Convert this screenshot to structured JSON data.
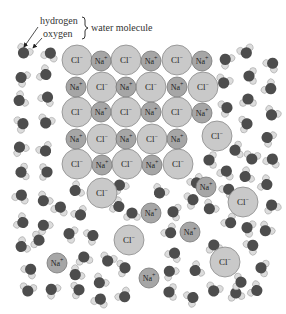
{
  "legend": {
    "hydrogen_label": "hydrogen",
    "oxygen_label": "oxygen",
    "molecule_label": "water molecule"
  },
  "colors": {
    "chloride_fill": "#c9c9c9",
    "chloride_stroke": "#8a8a8a",
    "sodium_fill": "#a6a6a6",
    "sodium_stroke": "#777777",
    "oxygen_fill": "#4d4d4d",
    "hydrogen_fill": "#dcdcdc",
    "hydrogen_stroke": "#999999"
  },
  "ions": [
    {
      "type": "Cl",
      "label": "Cl−",
      "x": 77,
      "y": 60
    },
    {
      "type": "Na",
      "label": "Na+",
      "x": 101,
      "y": 61
    },
    {
      "type": "Cl",
      "label": "Cl−",
      "x": 126,
      "y": 60
    },
    {
      "type": "Na",
      "label": "Na+",
      "x": 151,
      "y": 61
    },
    {
      "type": "Cl",
      "label": "Cl−",
      "x": 177,
      "y": 60
    },
    {
      "type": "Na",
      "label": "Na+",
      "x": 202,
      "y": 61
    },
    {
      "type": "Na",
      "label": "Na+",
      "x": 76,
      "y": 87
    },
    {
      "type": "Cl",
      "label": "Cl−",
      "x": 102,
      "y": 87
    },
    {
      "type": "Na",
      "label": "Na+",
      "x": 126,
      "y": 87
    },
    {
      "type": "Cl",
      "label": "Cl−",
      "x": 151,
      "y": 87
    },
    {
      "type": "Na",
      "label": "Na+",
      "x": 177,
      "y": 87
    },
    {
      "type": "Cl",
      "label": "Cl−",
      "x": 203,
      "y": 87
    },
    {
      "type": "Cl",
      "label": "Cl−",
      "x": 77,
      "y": 112
    },
    {
      "type": "Na",
      "label": "Na+",
      "x": 101,
      "y": 112
    },
    {
      "type": "Cl",
      "label": "Cl−",
      "x": 126,
      "y": 112
    },
    {
      "type": "Na",
      "label": "Na+",
      "x": 151,
      "y": 112
    },
    {
      "type": "Cl",
      "label": "Cl−",
      "x": 177,
      "y": 112
    },
    {
      "type": "Na",
      "label": "Na+",
      "x": 202,
      "y": 113
    },
    {
      "type": "Na",
      "label": "Na+",
      "x": 76,
      "y": 139
    },
    {
      "type": "Cl",
      "label": "Cl−",
      "x": 102,
      "y": 139
    },
    {
      "type": "Na",
      "label": "Na+",
      "x": 126,
      "y": 139
    },
    {
      "type": "Cl",
      "label": "Cl−",
      "x": 152,
      "y": 139
    },
    {
      "type": "Na",
      "label": "Na+",
      "x": 177,
      "y": 139
    },
    {
      "type": "Cl",
      "label": "Cl−",
      "x": 217,
      "y": 136
    },
    {
      "type": "Cl",
      "label": "Cl−",
      "x": 77,
      "y": 164
    },
    {
      "type": "Na",
      "label": "Na+",
      "x": 102,
      "y": 165
    },
    {
      "type": "Cl",
      "label": "Cl−",
      "x": 127,
      "y": 164
    },
    {
      "type": "Na",
      "label": "Na+",
      "x": 152,
      "y": 165
    },
    {
      "type": "Cl",
      "label": "Cl−",
      "x": 178,
      "y": 164
    },
    {
      "type": "Cl",
      "label": "Cl−",
      "x": 102,
      "y": 193
    },
    {
      "type": "Na",
      "label": "Na+",
      "x": 206,
      "y": 187
    },
    {
      "type": "Cl",
      "label": "Cl−",
      "x": 243,
      "y": 202
    },
    {
      "type": "Na",
      "label": "Na+",
      "x": 151,
      "y": 213
    },
    {
      "type": "Na",
      "label": "Na+",
      "x": 190,
      "y": 232
    },
    {
      "type": "Cl",
      "label": "Cl−",
      "x": 129,
      "y": 240
    },
    {
      "type": "Cl",
      "label": "Cl−",
      "x": 225,
      "y": 262
    },
    {
      "type": "Na",
      "label": "Na+",
      "x": 57,
      "y": 263
    },
    {
      "type": "Na",
      "label": "Na+",
      "x": 149,
      "y": 278
    }
  ],
  "water": [
    [
      24,
      52,
      30
    ],
    [
      50,
      54,
      200
    ],
    [
      22,
      78,
      120
    ],
    [
      45,
      74,
      300
    ],
    [
      20,
      100,
      60
    ],
    [
      47,
      98,
      210
    ],
    [
      22,
      124,
      250
    ],
    [
      46,
      122,
      20
    ],
    [
      20,
      148,
      150
    ],
    [
      45,
      150,
      330
    ],
    [
      22,
      172,
      80
    ],
    [
      46,
      172,
      270
    ],
    [
      21,
      196,
      200
    ],
    [
      44,
      200,
      40
    ],
    [
      22,
      222,
      300
    ],
    [
      44,
      226,
      140
    ],
    [
      22,
      246,
      60
    ],
    [
      30,
      270,
      220
    ],
    [
      28,
      290,
      10
    ],
    [
      52,
      290,
      130
    ],
    [
      78,
      290,
      260
    ],
    [
      100,
      282,
      40
    ],
    [
      100,
      300,
      200
    ],
    [
      124,
      296,
      320
    ],
    [
      170,
      292,
      90
    ],
    [
      192,
      298,
      240
    ],
    [
      214,
      290,
      20
    ],
    [
      236,
      294,
      170
    ],
    [
      256,
      290,
      300
    ],
    [
      262,
      268,
      100
    ],
    [
      252,
      246,
      230
    ],
    [
      266,
      230,
      40
    ],
    [
      272,
      206,
      160
    ],
    [
      266,
      184,
      300
    ],
    [
      246,
      176,
      60
    ],
    [
      272,
      160,
      200
    ],
    [
      252,
      158,
      10
    ],
    [
      268,
      138,
      120
    ],
    [
      246,
      124,
      260
    ],
    [
      272,
      114,
      30
    ],
    [
      248,
      100,
      180
    ],
    [
      270,
      88,
      310
    ],
    [
      250,
      76,
      90
    ],
    [
      272,
      64,
      220
    ],
    [
      246,
      52,
      340
    ],
    [
      226,
      60,
      130
    ],
    [
      224,
      82,
      20
    ],
    [
      226,
      108,
      250
    ],
    [
      236,
      150,
      80
    ],
    [
      226,
      172,
      200
    ],
    [
      230,
      222,
      320
    ],
    [
      248,
      228,
      110
    ],
    [
      210,
      208,
      40
    ],
    [
      214,
      246,
      170
    ],
    [
      240,
      282,
      280
    ],
    [
      196,
      270,
      60
    ],
    [
      174,
      254,
      210
    ],
    [
      170,
      232,
      320
    ],
    [
      174,
      212,
      100
    ],
    [
      192,
      200,
      250
    ],
    [
      160,
      192,
      30
    ],
    [
      132,
      214,
      180
    ],
    [
      118,
      206,
      300
    ],
    [
      76,
      190,
      60
    ],
    [
      60,
      208,
      200
    ],
    [
      80,
      214,
      330
    ],
    [
      70,
      234,
      110
    ],
    [
      92,
      236,
      240
    ],
    [
      108,
      260,
      20
    ],
    [
      84,
      258,
      170
    ],
    [
      38,
      240,
      280
    ],
    [
      76,
      274,
      50
    ],
    [
      124,
      268,
      260
    ],
    [
      170,
      272,
      140
    ],
    [
      196,
      182,
      330
    ],
    [
      210,
      160,
      90
    ],
    [
      228,
      190,
      220
    ],
    [
      120,
      186,
      150
    ]
  ]
}
